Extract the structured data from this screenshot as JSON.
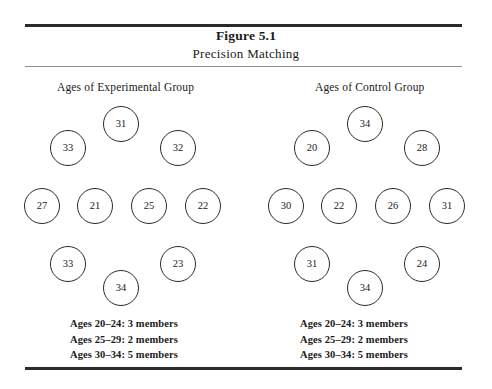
{
  "figure": {
    "title": "Figure 5.1",
    "subtitle": "Precision Matching"
  },
  "groups": [
    {
      "id": "experimental",
      "heading": "Ages of Experimental Group",
      "circles": [
        {
          "value": "31",
          "x": 103,
          "y": 106
        },
        {
          "value": "33",
          "x": 50,
          "y": 130
        },
        {
          "value": "32",
          "x": 160,
          "y": 130
        },
        {
          "value": "27",
          "x": 24,
          "y": 188
        },
        {
          "value": "21",
          "x": 77,
          "y": 188
        },
        {
          "value": "25",
          "x": 131,
          "y": 188
        },
        {
          "value": "22",
          "x": 185,
          "y": 188
        },
        {
          "value": "33",
          "x": 50,
          "y": 246
        },
        {
          "value": "23",
          "x": 160,
          "y": 246
        },
        {
          "value": "34",
          "x": 103,
          "y": 270
        }
      ],
      "summary": [
        "Ages 20–24: 3 members",
        "Ages 25–29: 2 members",
        "Ages 30–34: 5 members"
      ]
    },
    {
      "id": "control",
      "heading": "Ages of Control Group",
      "circles": [
        {
          "value": "34",
          "x": 347,
          "y": 106
        },
        {
          "value": "20",
          "x": 294,
          "y": 130
        },
        {
          "value": "28",
          "x": 404,
          "y": 130
        },
        {
          "value": "30",
          "x": 268,
          "y": 188
        },
        {
          "value": "22",
          "x": 321,
          "y": 188
        },
        {
          "value": "26",
          "x": 375,
          "y": 188
        },
        {
          "value": "31",
          "x": 429,
          "y": 188
        },
        {
          "value": "31",
          "x": 294,
          "y": 246
        },
        {
          "value": "24",
          "x": 404,
          "y": 246
        },
        {
          "value": "34",
          "x": 347,
          "y": 270
        }
      ],
      "summary": [
        "Ages 20–24: 3 members",
        "Ages 25–29: 2 members",
        "Ages 30–34: 5 members"
      ]
    }
  ],
  "chart_data": {
    "type": "diagram",
    "title": "Figure 5.1",
    "subtitle": "Precision Matching",
    "series": [
      {
        "name": "Ages of Experimental Group",
        "values": [
          31,
          33,
          32,
          27,
          21,
          25,
          22,
          33,
          23,
          34
        ],
        "bins": [
          {
            "range": "20–24",
            "count": 3
          },
          {
            "range": "25–29",
            "count": 2
          },
          {
            "range": "30–34",
            "count": 5
          }
        ]
      },
      {
        "name": "Ages of Control Group",
        "values": [
          34,
          20,
          28,
          30,
          22,
          26,
          31,
          31,
          24,
          34
        ],
        "bins": [
          {
            "range": "20–24",
            "count": 3
          },
          {
            "range": "25–29",
            "count": 2
          },
          {
            "range": "30–34",
            "count": 5
          }
        ]
      }
    ],
    "colors": {
      "stroke": "#2a2a2a",
      "background": "#ffffff",
      "rule": "#2b2b2b"
    }
  }
}
